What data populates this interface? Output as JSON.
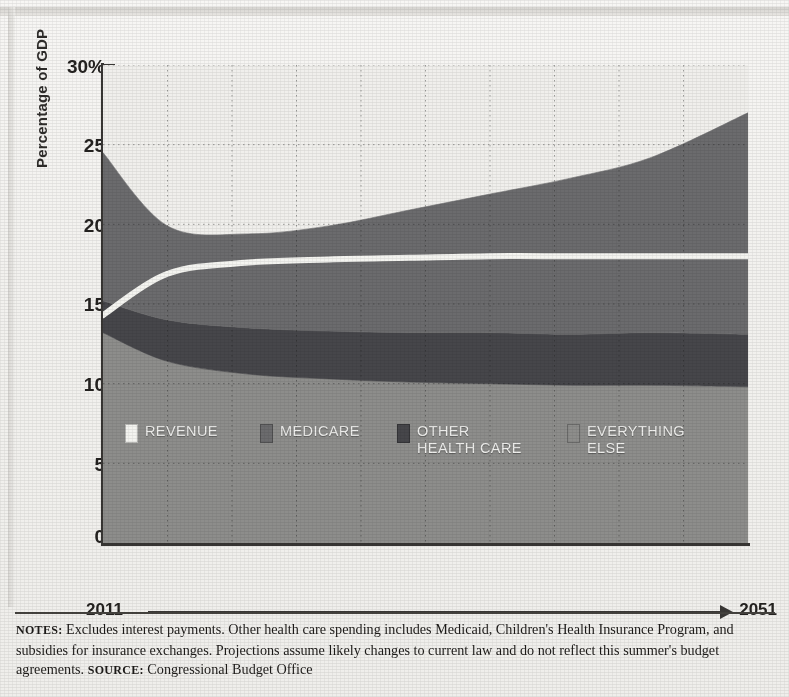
{
  "chart_data": {
    "type": "area",
    "title": "",
    "xlabel": "",
    "ylabel": "Percentage of GDP",
    "x_start_label": "2011",
    "x_end_label": "2051",
    "xlim": [
      2011,
      2051
    ],
    "ylim": [
      0,
      30
    ],
    "yticks": [
      "30%",
      "25",
      "20",
      "15",
      "10",
      "5",
      "0"
    ],
    "ytick_values": [
      30,
      25,
      20,
      15,
      10,
      5,
      0
    ],
    "grid": "dotted",
    "legend_position": "inside-lower-center",
    "stacked": true,
    "x": [
      2011,
      2015,
      2020,
      2025,
      2030,
      2035,
      2040,
      2045,
      2051
    ],
    "series": [
      {
        "name": "EVERYTHING ELSE",
        "color": "#8d8d8b",
        "kind": "stacked-area",
        "values": [
          13.2,
          11.4,
          10.6,
          10.3,
          10.1,
          10.0,
          9.9,
          9.9,
          9.8
        ]
      },
      {
        "name": "OTHER HEALTH CARE",
        "color": "#46464a",
        "kind": "stacked-area",
        "values": [
          2.0,
          2.6,
          2.9,
          3.0,
          3.1,
          3.2,
          3.2,
          3.3,
          3.3
        ]
      },
      {
        "name": "MEDICARE",
        "color": "#6b6b6d",
        "kind": "stacked-area",
        "values": [
          9.3,
          5.9,
          5.9,
          6.6,
          7.7,
          8.7,
          9.8,
          11.0,
          13.9
        ]
      },
      {
        "name": "REVENUE",
        "color": "#f4f4f0",
        "kind": "line",
        "values": [
          14.3,
          16.9,
          17.6,
          17.8,
          17.9,
          18.0,
          18.0,
          18.0,
          18.0
        ]
      }
    ],
    "stack_top": [
      24.5,
      19.9,
      19.4,
      19.9,
      20.9,
      21.9,
      22.9,
      24.2,
      27.0
    ],
    "notes": "Excludes interest payments. Other health care spending includes Medicaid, Children's Health Insurance Program, and subsidies for insurance exchanges. Projections assume likely changes to current law and do not reflect this summer's budget agreements.",
    "source": "Congressional Budget Office"
  },
  "axis": {
    "ylabel": "Percentage of GDP",
    "yticks": [
      "30%",
      "25",
      "20",
      "15",
      "10",
      "5",
      "0"
    ],
    "year_start": "2011",
    "year_end": "2051"
  },
  "legend": {
    "items": [
      {
        "label": "REVENUE",
        "color": "#f4f4f0"
      },
      {
        "label": "MEDICARE",
        "color": "#6b6b6d"
      },
      {
        "label": "OTHER",
        "label2": "HEALTH CARE",
        "color": "#46464a"
      },
      {
        "label": "EVERYTHING",
        "label2": "ELSE",
        "color": "#8d8d8b"
      }
    ]
  },
  "footer": {
    "notes_kicker": "NOTES:",
    "notes_text": " Excludes interest payments. Other health care spending includes Medicaid, Children's Health Insurance Program, and subsidies for insurance exchanges. Projections assume likely changes to current law and do not reflect this summer's budget agreements. ",
    "source_kicker": "SOURCE:",
    "source_text": " Congressional Budget Office"
  }
}
